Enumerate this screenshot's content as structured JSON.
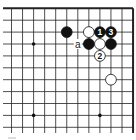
{
  "diagram": {
    "type": "go-board-fragment",
    "grid": {
      "cols": 12,
      "rows": 11,
      "x0": 11.5,
      "dx": 11.05,
      "y0": 8.3,
      "dy": 11.9,
      "top_edge": true,
      "right_edge": true
    },
    "star_points": [
      [
        2,
        3
      ],
      [
        8,
        3
      ],
      [
        2,
        9
      ],
      [
        8,
        9
      ]
    ],
    "stones": [
      {
        "col": 5,
        "row": 2,
        "color": "black",
        "label": ""
      },
      {
        "col": 7,
        "row": 2,
        "color": "white",
        "label": ""
      },
      {
        "col": 8,
        "row": 2,
        "color": "black",
        "label": "1"
      },
      {
        "col": 9,
        "row": 2,
        "color": "black",
        "label": "3"
      },
      {
        "col": 7,
        "row": 3,
        "color": "black",
        "label": ""
      },
      {
        "col": 8,
        "row": 3,
        "color": "white",
        "label": ""
      },
      {
        "col": 9,
        "row": 3,
        "color": "black",
        "label": ""
      },
      {
        "col": 8,
        "row": 4,
        "color": "white",
        "label": "2"
      },
      {
        "col": 9,
        "row": 6,
        "color": "white",
        "label": ""
      }
    ],
    "marks": [
      {
        "col": 6,
        "row": 3,
        "text": "a"
      }
    ]
  }
}
